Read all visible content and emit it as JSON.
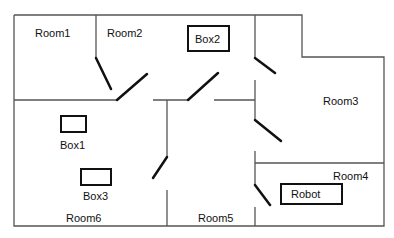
{
  "title": "",
  "rooms": [
    {
      "id": "room1",
      "label": "Room1",
      "x": 35,
      "y": 27
    },
    {
      "id": "room2",
      "label": "Room2",
      "x": 107,
      "y": 27
    },
    {
      "id": "room3",
      "label": "Room3",
      "x": 323,
      "y": 95
    },
    {
      "id": "room4",
      "label": "Room4",
      "x": 333,
      "y": 170
    },
    {
      "id": "room5",
      "label": "Room5",
      "x": 198,
      "y": 212
    },
    {
      "id": "room6",
      "label": "Room6",
      "x": 66,
      "y": 212
    }
  ],
  "objects": [
    {
      "id": "box1",
      "label": "Box1",
      "box": {
        "x": 60,
        "y": 115,
        "w": 27,
        "h": 18
      },
      "label_pos": {
        "x": 60,
        "y": 140
      },
      "label_inside": false
    },
    {
      "id": "box2",
      "label": "Box2",
      "box": {
        "x": 187,
        "y": 25,
        "w": 43,
        "h": 27
      },
      "label_pos": {
        "x": 195,
        "y": 33
      },
      "label_inside": true
    },
    {
      "id": "box3",
      "label": "Box3",
      "box": {
        "x": 80,
        "y": 168,
        "w": 32,
        "h": 18
      },
      "label_pos": {
        "x": 83,
        "y": 190
      },
      "label_inside": false
    },
    {
      "id": "robot",
      "label": "Robot",
      "box": {
        "x": 280,
        "y": 183,
        "w": 63,
        "h": 22
      },
      "label_pos": {
        "x": 291,
        "y": 188
      },
      "label_inside": true
    }
  ],
  "colors": {
    "wall": "#555555",
    "door": "#111111",
    "box": "#111111",
    "background": "#ffffff"
  }
}
